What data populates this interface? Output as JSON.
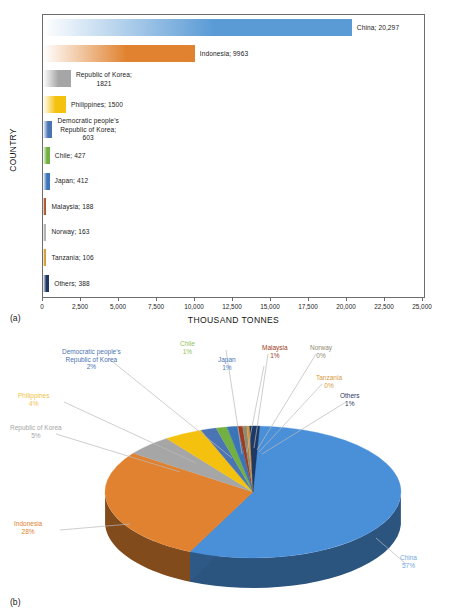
{
  "figure": {
    "panel_a_caption": "(a)",
    "panel_b_caption": "(b)"
  },
  "bar_chart": {
    "xaxis_title": "THOUSAND TONNES",
    "yaxis_title": "COUNTRY",
    "ticks": [
      "0",
      "2,500",
      "5,000",
      "7,500",
      "10,000",
      "12,500",
      "15,000",
      "17,500",
      "20,000",
      "22,500",
      "25,000"
    ],
    "labels": [
      "China; 20,297",
      "Indonesia; 9963",
      "Republic of Korea;\n1821",
      "Philippines; 1500",
      "Democratic people's\nRepublic of Korea;\n603",
      "Chile; 427",
      "Japan; 412",
      "Malaysia; 188",
      "Norway; 163",
      "Tanzania; 106",
      "Others; 388"
    ]
  },
  "chart_data": [
    {
      "type": "bar",
      "orientation": "horizontal",
      "title": "",
      "xlabel": "THOUSAND TONNES",
      "ylabel": "COUNTRY",
      "xlim": [
        0,
        25000
      ],
      "xticks": [
        0,
        2500,
        5000,
        7500,
        10000,
        12500,
        15000,
        17500,
        20000,
        22500,
        25000
      ],
      "grid": false,
      "legend": "none",
      "categories": [
        "China",
        "Indonesia",
        "Republic of Korea",
        "Philippines",
        "Democratic people's Republic of Korea",
        "Chile",
        "Japan",
        "Malaysia",
        "Norway",
        "Tanzania",
        "Others"
      ],
      "values": [
        20297,
        9963,
        1821,
        1500,
        603,
        427,
        412,
        188,
        163,
        106,
        388
      ],
      "colors": [
        "#5b9bd5",
        "#e0822f",
        "#a6a6a6",
        "#f4c10e",
        "#4a74b4",
        "#73b043",
        "#3c74b8",
        "#a9562a",
        "#b0b0ae",
        "#d79a3a",
        "#1f3864"
      ]
    },
    {
      "type": "pie",
      "title": "",
      "labels": [
        "China",
        "Indonesia",
        "Republic of Korea",
        "Philippines",
        "Democratic people's Republic of Korea",
        "Chile",
        "Japan",
        "Malaysia",
        "Norway",
        "Tanzania",
        "Others"
      ],
      "values": [
        57,
        28,
        5,
        4,
        2,
        1,
        1,
        1,
        0,
        0,
        1
      ],
      "value_unit": "%",
      "colors": [
        "#4a90d9",
        "#e0822f",
        "#a6a6a6",
        "#f4c10e",
        "#4a74b4",
        "#73b043",
        "#3c74b8",
        "#9e3b20",
        "#8f8a74",
        "#d79a3a",
        "#1f3864"
      ],
      "legend": "labels-outside",
      "style": "3d"
    }
  ],
  "pie_labels": [
    {
      "name": "Democratic people's Republic of Korea",
      "text": "Democratic people's\nRepublic of Korea\n2%",
      "color": "#4a74b4"
    },
    {
      "name": "Chile",
      "text": "Chile\n1%",
      "color": "#8fbf5a"
    },
    {
      "name": "Japan",
      "text": "Japan\n1%",
      "color": "#4a78b8"
    },
    {
      "name": "Malaysia",
      "text": "Malaysia\n1%",
      "color": "#9e3b20"
    },
    {
      "name": "Norway",
      "text": "Norway\n0%",
      "color": "#8f8a74"
    },
    {
      "name": "Tanzania",
      "text": "Tanzania\n0%",
      "color": "#d79a3a"
    },
    {
      "name": "Others",
      "text": "Others\n1%",
      "color": "#1f3864"
    },
    {
      "name": "Philippines",
      "text": "Philippines\n4%",
      "color": "#f0c24a"
    },
    {
      "name": "Republic of Korea",
      "text": "Republic of Korea\n5%",
      "color": "#a6a6a6"
    },
    {
      "name": "Indonesia",
      "text": "Indonesia\n28%",
      "color": "#e0822f"
    },
    {
      "name": "China",
      "text": "China\n57%",
      "color": "#6fa8dc"
    }
  ]
}
